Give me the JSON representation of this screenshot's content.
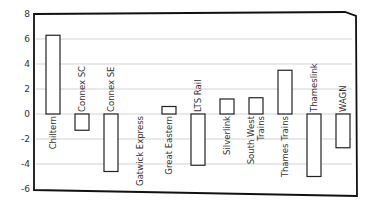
{
  "chart_data": {
    "type": "bar",
    "title": "",
    "xlabel": "",
    "ylabel": "",
    "ylim": [
      -6,
      8
    ],
    "yticks": [
      8,
      6,
      4,
      2,
      0,
      -2,
      -4,
      -6
    ],
    "grid": true,
    "legend": null,
    "style": "hand-drawn / sketch",
    "labels_inside_rotated": true,
    "categories": [
      "Chiltern",
      "Connex SC",
      "Connex SE",
      "Gatwick Express",
      "Great Eastern",
      "LTS Rail",
      "Silverlink",
      "South West Trains",
      "Thames Trains",
      "Thameslink",
      "WAGN"
    ],
    "values": [
      6.3,
      -1.3,
      -4.6,
      0.0,
      0.6,
      -4.1,
      1.2,
      1.3,
      3.5,
      -5.0,
      -2.7
    ]
  },
  "colors": {
    "bar_fill": "#ffffff",
    "bar_stroke": "#222222",
    "grid": "#c8c8c8",
    "axis": "#111111"
  }
}
